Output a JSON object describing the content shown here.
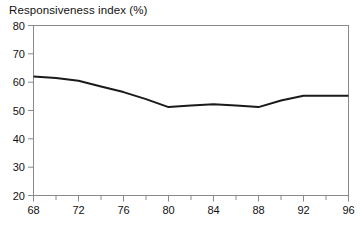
{
  "chart_data": {
    "type": "line",
    "title": "Responsiveness index (%)",
    "xlabel": "",
    "ylabel": "",
    "x": [
      68,
      70,
      72,
      74,
      76,
      78,
      80,
      82,
      84,
      86,
      88,
      90,
      92,
      94,
      96
    ],
    "values": [
      62,
      61.5,
      60.5,
      58.5,
      56.5,
      54,
      51.2,
      51.8,
      52.2,
      51.8,
      51.2,
      53.5,
      55.2,
      55.2,
      55.2
    ],
    "series": [
      {
        "name": "Responsiveness index",
        "values": [
          62,
          61.5,
          60.5,
          58.5,
          56.5,
          54,
          51.2,
          51.8,
          52.2,
          51.8,
          51.2,
          53.5,
          55.2,
          55.2,
          55.2
        ]
      }
    ],
    "xlim": [
      68,
      96
    ],
    "ylim": [
      20,
      80
    ],
    "x_major_ticks": [
      68,
      72,
      76,
      80,
      84,
      88,
      92,
      96
    ],
    "x_minor_ticks": [
      70,
      74,
      78,
      82,
      86,
      90,
      94
    ],
    "y_ticks": [
      20,
      30,
      40,
      50,
      60,
      70,
      80
    ],
    "x_tick_labels": [
      "68",
      "72",
      "76",
      "80",
      "84",
      "88",
      "92",
      "96"
    ],
    "y_tick_labels": [
      "20",
      "30",
      "40",
      "50",
      "60",
      "70",
      "80"
    ],
    "grid": false,
    "legend": null,
    "line_color": "#1a1a1a",
    "frame_color": "#8a8a8a",
    "background": "#ffffff"
  }
}
